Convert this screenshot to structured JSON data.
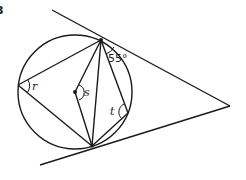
{
  "diagram": {
    "question_number": "3",
    "type": "circle-theorems",
    "labels": {
      "angle_given": "55°",
      "r": "r",
      "s": "s",
      "t": "t"
    },
    "colors": {
      "stroke": "#1a1a1a",
      "background": "#ffffff"
    }
  }
}
